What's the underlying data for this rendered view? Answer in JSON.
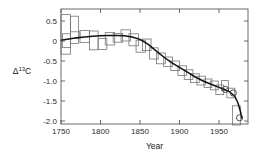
{
  "chart_data": {
    "type": "bar",
    "title": "",
    "subtitle": "",
    "xlabel": "Year",
    "ylabel": "Δ13C",
    "ylabel_base": "Δ",
    "ylabel_sup": "13",
    "ylabel_tail": "C",
    "xlim": [
      1740,
      1985
    ],
    "ylim": [
      -2.2,
      0.75
    ],
    "grid": false,
    "legend": null,
    "xticks": [
      1750,
      1800,
      1850,
      1900,
      1950
    ],
    "xtick_labels": [
      "1750",
      "1800",
      "1850",
      "1900",
      "1950"
    ],
    "yticks": [
      0.5,
      0.0,
      -0.5,
      -1.0,
      -1.5,
      -2.0
    ],
    "ytick_labels": [
      "0.5",
      "0",
      "-0.5",
      "-1.0",
      "-1.5",
      "-2.0"
    ],
    "series": [
      {
        "name": "measurement boxes",
        "kind": "box-range",
        "note": "Each box spans a decade in x and an uncertainty range in y",
        "boxes": [
          {
            "x0": 1750,
            "x1": 1762,
            "y_low": -0.33,
            "y_high": 0.66
          },
          {
            "x0": 1752,
            "x1": 1762,
            "y_low": -0.16,
            "y_high": 0.18
          },
          {
            "x0": 1762,
            "x1": 1772,
            "y_low": -0.06,
            "y_high": 0.62
          },
          {
            "x0": 1762,
            "x1": 1774,
            "y_low": 0.06,
            "y_high": 0.23
          },
          {
            "x0": 1774,
            "x1": 1786,
            "y_low": -0.04,
            "y_high": 0.26
          },
          {
            "x0": 1786,
            "x1": 1797,
            "y_low": -0.22,
            "y_high": 0.25
          },
          {
            "x0": 1797,
            "x1": 1808,
            "y_low": -0.21,
            "y_high": 0.06
          },
          {
            "x0": 1806,
            "x1": 1818,
            "y_low": -0.1,
            "y_high": 0.21
          },
          {
            "x0": 1816,
            "x1": 1828,
            "y_low": -0.03,
            "y_high": 0.19
          },
          {
            "x0": 1826,
            "x1": 1838,
            "y_low": 0.0,
            "y_high": 0.28
          },
          {
            "x0": 1836,
            "x1": 1848,
            "y_low": -0.12,
            "y_high": 0.18
          },
          {
            "x0": 1845,
            "x1": 1857,
            "y_low": -0.28,
            "y_high": 0.02
          },
          {
            "x0": 1853,
            "x1": 1864,
            "y_low": -0.24,
            "y_high": 0.05
          },
          {
            "x0": 1862,
            "x1": 1873,
            "y_low": -0.45,
            "y_high": -0.17
          },
          {
            "x0": 1871,
            "x1": 1882,
            "y_low": -0.57,
            "y_high": -0.3
          },
          {
            "x0": 1880,
            "x1": 1891,
            "y_low": -0.64,
            "y_high": -0.4
          },
          {
            "x0": 1889,
            "x1": 1900,
            "y_low": -0.74,
            "y_high": -0.5
          },
          {
            "x0": 1898,
            "x1": 1909,
            "y_low": -0.86,
            "y_high": -0.62
          },
          {
            "x0": 1906,
            "x1": 1917,
            "y_low": -0.96,
            "y_high": -0.72
          },
          {
            "x0": 1914,
            "x1": 1925,
            "y_low": -1.04,
            "y_high": -0.82
          },
          {
            "x0": 1922,
            "x1": 1933,
            "y_low": -1.1,
            "y_high": -0.88
          },
          {
            "x0": 1931,
            "x1": 1941,
            "y_low": -1.16,
            "y_high": -0.95
          },
          {
            "x0": 1939,
            "x1": 1949,
            "y_low": -1.22,
            "y_high": -1.0
          },
          {
            "x0": 1946,
            "x1": 1956,
            "y_low": -1.34,
            "y_high": -1.1
          },
          {
            "x0": 1953,
            "x1": 1962,
            "y_low": -1.24,
            "y_high": -0.99
          },
          {
            "x0": 1960,
            "x1": 1970,
            "y_low": -1.42,
            "y_high": -1.18
          },
          {
            "x0": 1967,
            "x1": 1977,
            "y_low": -2.1,
            "y_high": -1.62
          }
        ]
      },
      {
        "name": "smooth fit",
        "kind": "line",
        "x": [
          1750,
          1760,
          1770,
          1780,
          1790,
          1800,
          1810,
          1820,
          1830,
          1840,
          1850,
          1860,
          1870,
          1880,
          1890,
          1900,
          1910,
          1920,
          1930,
          1940,
          1950,
          1958,
          1964,
          1970,
          1974,
          1977,
          1979
        ],
        "y": [
          0.02,
          0.05,
          0.08,
          0.1,
          0.12,
          0.13,
          0.14,
          0.14,
          0.13,
          0.1,
          0.04,
          -0.08,
          -0.24,
          -0.4,
          -0.54,
          -0.66,
          -0.78,
          -0.9,
          -1.0,
          -1.08,
          -1.16,
          -1.22,
          -1.28,
          -1.38,
          -1.55,
          -1.75,
          -1.93
        ]
      },
      {
        "name": "circle markers",
        "kind": "scatter",
        "x": [
          1958,
          1968,
          1976
        ],
        "y": [
          -1.21,
          -1.3,
          -1.92
        ]
      }
    ]
  },
  "colors": {
    "box_stroke": "#767676",
    "fit_line": "#111111",
    "axis": "#5a5a5a",
    "text": "#1a1a1a",
    "background": "#ffffff"
  }
}
